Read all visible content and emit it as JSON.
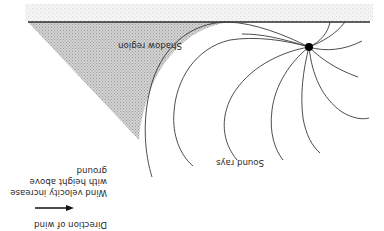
{
  "diagram": {
    "orientation": "rotated 180 degrees (upside down)",
    "labels": {
      "shadow_region": "Shadow region",
      "sound_rays": "Sound rays",
      "wind_velocity_line1": "Wind velocity increase",
      "wind_velocity_line2": "with height above",
      "wind_velocity_line3": "ground",
      "direction_of_wind": "Direction of wind"
    },
    "colors": {
      "ground_line": "#2a2a2a",
      "shadow_fill": "#c8c8c8",
      "rays": "#3a3a3a",
      "source": "#000000",
      "ground_texture": "#e6e6e6"
    },
    "elements": {
      "source": "sound source point",
      "ground": "ground surface line",
      "shadow": "shadow region (upwind)",
      "arrow": "wind direction arrow"
    }
  }
}
